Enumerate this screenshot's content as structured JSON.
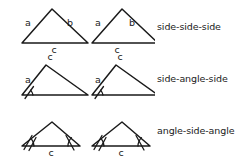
{
  "diagram": {
    "background_color": "#ffffff",
    "stroke_color": "#1a1a1a",
    "text_color": "#1a1a1a",
    "rows": [
      {
        "id": "sss",
        "criterion_label": "side-side-side",
        "side_labels": [
          "a",
          "b",
          "c"
        ],
        "angle_marks": 0,
        "triangles": 2,
        "description": "Two congruent triangles with all three sides labeled a, b and c"
      },
      {
        "id": "sas",
        "criterion_label": "side-angle-side",
        "side_labels": [
          "a",
          "c"
        ],
        "angle_marks": 1,
        "triangles": 2,
        "description": "Two congruent triangles with sides a and c labeled and the included angle marked at the lower-left vertex"
      },
      {
        "id": "asa",
        "criterion_label": "angle-side-angle",
        "side_labels": [
          "c"
        ],
        "angle_marks": 2,
        "triangles": 2,
        "description": "Two congruent triangles with side c labeled and both base angles marked"
      }
    ]
  }
}
